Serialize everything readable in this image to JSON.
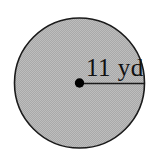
{
  "figure": {
    "type": "geometry-diagram",
    "shape": "circle",
    "background_color": "#ffffff",
    "fill_color": "#a9a9a9",
    "outline_color": "#1a1a1a",
    "line_color": "#1a1a1a",
    "center_dot_color": "#000000",
    "label_color": "#111111",
    "circle": {
      "center_x": 79.5,
      "center_y": 83,
      "radius_px": 65.5
    },
    "radius_segment": {
      "from_x": 79.5,
      "from_y": 83,
      "to_x": 145,
      "to_y": 83
    },
    "center_dot": {
      "cx": 79.5,
      "cy": 83,
      "r": 4.6
    },
    "measurement": {
      "value": "11",
      "unit": "yd",
      "label": "11 yd"
    }
  }
}
